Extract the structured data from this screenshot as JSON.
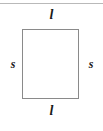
{
  "figure": {
    "name": "labeled-rectangle-diagram",
    "background_color": "#ffffff",
    "top_rule_color": "#b9b9b9",
    "shape": {
      "type": "rectangle",
      "border_color": "#8a8a8a",
      "fill_color": "#ffffff"
    },
    "labels": {
      "top": "l",
      "bottom": "l",
      "left": "s",
      "right": "s",
      "text_color": "#1a1a1a"
    }
  }
}
